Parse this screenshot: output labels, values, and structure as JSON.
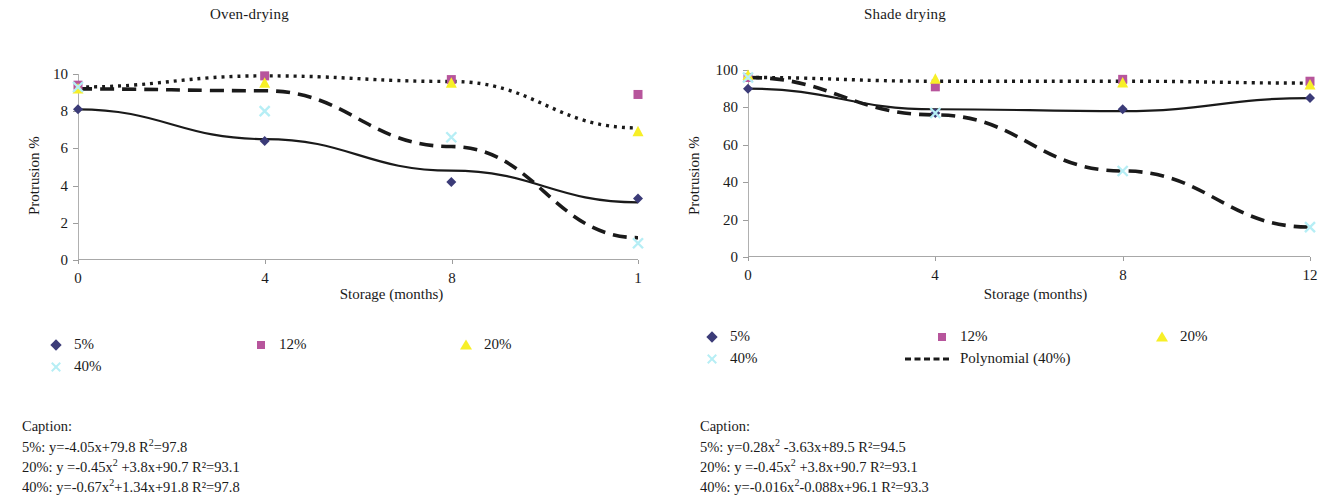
{
  "figure": {
    "panels": [
      {
        "id": "oven-drying",
        "title": "Oven-drying",
        "ylabel": "Protrusion %",
        "xlabel": "Storage (months)",
        "ytick_labels": [
          "10",
          "8",
          "6",
          "4",
          "2",
          "0"
        ],
        "xtick_labels": [
          "0",
          "4",
          "8",
          "1"
        ],
        "legend": [
          {
            "label": "5%",
            "marker": "diamond",
            "color": "#3b3b78"
          },
          {
            "label": "12%",
            "marker": "square",
            "color": "#b7559c"
          },
          {
            "label": "20%",
            "marker": "triangle",
            "color": "#f7ef27"
          },
          {
            "label": "40%",
            "marker": "cross",
            "color": "#b6eef5"
          }
        ],
        "caption": {
          "heading": "Caption:",
          "lines": [
            {
              "prefix": "5%: y=-4.05x+79.8 R",
              "sup": "2",
              "suffix": "=97.8"
            },
            {
              "prefix": "20%: y =-0.45x",
              "sup": "2",
              "suffix": " +3.8x+90.7 R²=93.1",
              "mid_sup": true
            },
            {
              "prefix": "40%: y=-0.67x",
              "sup": "2",
              "suffix": "+1.34x+91.8 R²=97.8"
            }
          ]
        }
      },
      {
        "id": "shade-drying",
        "title": "Shade drying",
        "ylabel": "Protrusion %",
        "xlabel": "Storage (months)",
        "ytick_labels": [
          "100",
          "80",
          "60",
          "40",
          "20",
          "0"
        ],
        "xtick_labels": [
          "0",
          "4",
          "8",
          "12"
        ],
        "legend": [
          {
            "label": "5%",
            "marker": "diamond",
            "color": "#3b3b78"
          },
          {
            "label": "12%",
            "marker": "square",
            "color": "#b7559c"
          },
          {
            "label": "20%",
            "marker": "triangle",
            "color": "#f7ef27"
          },
          {
            "label": "40%",
            "marker": "cross",
            "color": "#b6eef5"
          },
          {
            "label": "Polynomial (40%)",
            "marker": "dashed-line",
            "color": "#1a1a1a"
          }
        ],
        "caption": {
          "heading": "Caption:",
          "lines": [
            {
              "prefix": "5%: y=0.28x",
              "sup": "2",
              "suffix": " -3.63x+89.5 R²=94.5"
            },
            {
              "prefix": "20%: y =-0.45x",
              "sup": "2",
              "suffix": " +3.8x+90.7 R²=93.1"
            },
            {
              "prefix": "40%: y=-0.016x",
              "sup": "2",
              "suffix": "-0.088x+96.1 R²=93.3"
            }
          ]
        }
      }
    ]
  },
  "chart_data": [
    {
      "type": "scatter",
      "title": "Oven-drying",
      "xlabel": "Storage (months)",
      "ylabel": "Protrusion %",
      "xlim": [
        0,
        12
      ],
      "ylim": [
        0,
        10
      ],
      "xticks": [
        0,
        4,
        8,
        12
      ],
      "xticklabels": [
        "0",
        "4",
        "8",
        "1"
      ],
      "yticks": [
        0,
        2,
        4,
        6,
        8,
        10
      ],
      "grid": false,
      "legend_position": "below",
      "x": [
        0,
        4,
        8,
        12
      ],
      "series": [
        {
          "name": "5%",
          "marker": "diamond",
          "color": "#3b3b78",
          "values": [
            8.1,
            6.4,
            4.2,
            3.3
          ]
        },
        {
          "name": "12%",
          "marker": "square",
          "color": "#b7559c",
          "values": [
            9.4,
            9.9,
            9.7,
            8.9
          ]
        },
        {
          "name": "20%",
          "marker": "triangle",
          "color": "#f7ef27",
          "values": [
            9.2,
            9.5,
            9.5,
            6.9
          ]
        },
        {
          "name": "40%",
          "marker": "cross",
          "color": "#b6eef5",
          "values": [
            9.3,
            8.0,
            6.6,
            0.9
          ]
        }
      ],
      "fits": [
        {
          "name": "Linear (5%)",
          "style": "solid",
          "equation": "y=-4.05x+79.8",
          "r2": 97.8,
          "points": [
            8.1,
            6.5,
            4.8,
            3.1
          ]
        },
        {
          "name": "Polynomial (20%)",
          "style": "dotted",
          "equation": "y =-0.45x² +3.8x+90.7",
          "r2": 93.1,
          "points": [
            9.3,
            9.9,
            9.6,
            7.1
          ]
        },
        {
          "name": "Polynomial (40%)",
          "style": "dashed",
          "equation": "y=-0.67x²+1.34x+91.8",
          "r2": 97.8,
          "points": [
            9.2,
            9.1,
            6.1,
            1.2
          ]
        }
      ]
    },
    {
      "type": "scatter",
      "title": "Shade drying",
      "xlabel": "Storage (months)",
      "ylabel": "Protrusion %",
      "xlim": [
        0,
        12
      ],
      "ylim": [
        0,
        100
      ],
      "xticks": [
        0,
        4,
        8,
        12
      ],
      "xticklabels": [
        "0",
        "4",
        "8",
        "12"
      ],
      "yticks": [
        0,
        20,
        40,
        60,
        80,
        100
      ],
      "grid": false,
      "legend_position": "below",
      "x": [
        0,
        4,
        8,
        12
      ],
      "series": [
        {
          "name": "5%",
          "marker": "diamond",
          "color": "#3b3b78",
          "values": [
            90,
            77,
            79,
            85
          ]
        },
        {
          "name": "12%",
          "marker": "square",
          "color": "#b7559c",
          "values": [
            96,
            91,
            95,
            94
          ]
        },
        {
          "name": "20%",
          "marker": "triangle",
          "color": "#f7ef27",
          "values": [
            97,
            95,
            93,
            92
          ]
        },
        {
          "name": "40%",
          "marker": "cross",
          "color": "#b6eef5",
          "values": [
            96,
            77,
            46,
            16
          ]
        }
      ],
      "fits": [
        {
          "name": "Polynomial (5%)",
          "style": "solid",
          "equation": "y=0.28x² -3.63x+89.5",
          "r2": 94.5,
          "points": [
            90,
            79,
            78,
            85
          ]
        },
        {
          "name": "Polynomial (20%)",
          "style": "dotted",
          "equation": "y =-0.45x² +3.8x+90.7",
          "r2": 93.1,
          "points": [
            96,
            94,
            94,
            93
          ]
        },
        {
          "name": "Polynomial (40%)",
          "style": "dashed",
          "equation": "y=-0.016x²-0.088x+96.1",
          "r2": 93.3,
          "points": [
            96,
            76,
            46,
            16
          ]
        }
      ]
    }
  ]
}
